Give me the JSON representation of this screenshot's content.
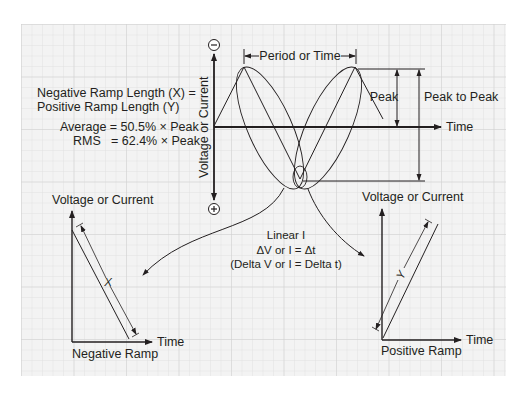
{
  "colors": {
    "background": "#ffffff",
    "grid_fill": "#f3f3f3",
    "grid_line": "#dedede",
    "grid_major": "#d2d2d2",
    "ink": "#231f20"
  },
  "formula": {
    "line1": "Negative Ramp Length (X) =",
    "line2": "Positive Ramp Length (Y)",
    "average": "Average = 50.5% × Peak",
    "rms_label": "RMS",
    "rms_value": "= 62.4% × Peak"
  },
  "main_graph": {
    "y_axis_label": "Voltage or Current",
    "negative_symbol": "−",
    "positive_symbol": "+",
    "x_axis_label": "Time",
    "period_label": "Period or Time",
    "peak_label": "Peak",
    "peak_to_peak_label": "Peak to Peak"
  },
  "linear_note": {
    "line1": "Linear I",
    "line2": "ΔV or I = Δt",
    "line3": "(Delta V or I = Delta t)"
  },
  "negative_ramp": {
    "y_axis_label": "Voltage or Current",
    "x_axis_label": "Time",
    "title": "Negative Ramp",
    "dimension_label": "X"
  },
  "positive_ramp": {
    "y_axis_label": "Voltage or Current",
    "x_axis_label": "Time",
    "title": "Positive Ramp",
    "dimension_label": "Y"
  }
}
